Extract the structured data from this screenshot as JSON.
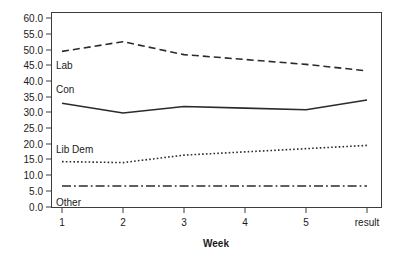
{
  "chart_data": {
    "type": "line",
    "title": "",
    "xlabel": "Week",
    "ylabel": "",
    "x": [
      "1",
      "2",
      "3",
      "4",
      "5",
      "result"
    ],
    "categories": [
      "1",
      "2",
      "3",
      "4",
      "5",
      "result"
    ],
    "xtick_labels": [
      "1",
      "2",
      "3",
      "4",
      "5",
      "result"
    ],
    "ytick_labels": [
      "0.0",
      "5.0",
      "10.0",
      "15.0",
      "20.0",
      "25.0",
      "30.0",
      "35.0",
      "40.0",
      "45.0",
      "50.0",
      "55.0",
      "60.0"
    ],
    "ytick_values": [
      0,
      5,
      10,
      15,
      20,
      25,
      30,
      35,
      40,
      45,
      50,
      55,
      60
    ],
    "ylim": [
      0,
      60
    ],
    "grid": false,
    "legend_position": "inline-labels",
    "series": [
      {
        "name": "Lab",
        "label": "Lab",
        "line_style": "dashed",
        "color": "#2b2b2b",
        "values": [
          48,
          51,
          47,
          45.5,
          44,
          42
        ]
      },
      {
        "name": "Con",
        "label": "Con",
        "line_style": "solid",
        "color": "#2b2b2b",
        "values": [
          32,
          29,
          31,
          30.5,
          30,
          33
        ]
      },
      {
        "name": "Lib Dem",
        "label": "Lib Dem",
        "line_style": "dotted",
        "color": "#2b2b2b",
        "values": [
          14,
          13.7,
          16,
          17,
          18,
          19
        ]
      },
      {
        "name": "Other",
        "label": "Other",
        "line_style": "dashdot",
        "color": "#2b2b2b",
        "values": [
          6.5,
          6.5,
          6.5,
          6.5,
          6.5,
          6.5
        ]
      }
    ],
    "annotations": [
      {
        "text": "Lab",
        "series": "Lab"
      },
      {
        "text": "Con",
        "series": "Con"
      },
      {
        "text": "Lib Dem",
        "series": "Lib Dem"
      },
      {
        "text": "Other",
        "series": "Other"
      }
    ]
  }
}
